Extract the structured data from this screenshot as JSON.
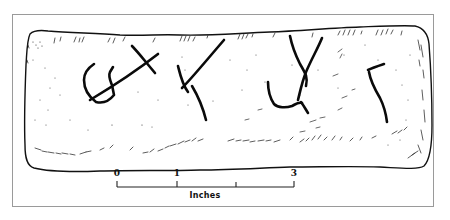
{
  "figure": {
    "inscription_glyph_count": 4,
    "stroke_color": "#111111",
    "frame_color": "#9a9a9a"
  },
  "scale_bar": {
    "labels": [
      {
        "text": "0",
        "x": 117
      },
      {
        "text": "1",
        "x": 177
      },
      {
        "text": "3",
        "x": 294
      }
    ],
    "ticks_x": [
      117,
      177,
      236,
      294
    ],
    "units": "Inches"
  }
}
